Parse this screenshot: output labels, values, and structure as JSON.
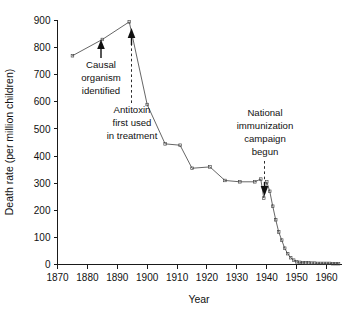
{
  "chart_data": {
    "type": "line",
    "title": "",
    "xlabel": "Year",
    "ylabel": "Death rate (per million children)",
    "xlim": [
      1870,
      1965
    ],
    "ylim": [
      0,
      900
    ],
    "xticks": [
      1870,
      1880,
      1890,
      1900,
      1910,
      1920,
      1930,
      1940,
      1950,
      1960
    ],
    "yticks": [
      0,
      100,
      200,
      300,
      400,
      500,
      600,
      700,
      800,
      900
    ],
    "grid": false,
    "legend": "none",
    "series": [
      {
        "name": "Diphtheria death rate",
        "x": [
          1875,
          1885,
          1894,
          1900,
          1906,
          1911,
          1915,
          1921,
          1926,
          1931,
          1936,
          1938,
          1939,
          1940,
          1941,
          1942,
          1943,
          1944,
          1945,
          1946,
          1947,
          1948,
          1949,
          1950,
          1951,
          1952,
          1953,
          1954,
          1955,
          1956,
          1957,
          1958,
          1959,
          1960,
          1961,
          1962,
          1963,
          1964
        ],
        "values": [
          770,
          830,
          895,
          590,
          445,
          440,
          355,
          360,
          310,
          305,
          305,
          315,
          245,
          305,
          270,
          215,
          165,
          120,
          90,
          60,
          40,
          25,
          16,
          10,
          8,
          7,
          6,
          6,
          5,
          5,
          4,
          4,
          4,
          4,
          4,
          3,
          3,
          3
        ],
        "marker": "square",
        "color": "#4a4a4a"
      }
    ],
    "annotations": [
      {
        "id": "causal-organism",
        "lines": [
          "Causal",
          "organism",
          "identified"
        ],
        "target_year": 1884,
        "target_value": 828,
        "marker": "arrow"
      },
      {
        "id": "antitoxin",
        "lines": [
          "Antitoxin",
          "first used",
          "in treatment"
        ],
        "target_year": 1894,
        "target_value": 880,
        "marker": "dashed-arrow"
      },
      {
        "id": "national-immunization",
        "lines": [
          "National",
          "immunization",
          "campaign",
          "begun"
        ],
        "target_year": 1941,
        "target_value": 330,
        "marker": "dashed-arrow"
      }
    ]
  }
}
